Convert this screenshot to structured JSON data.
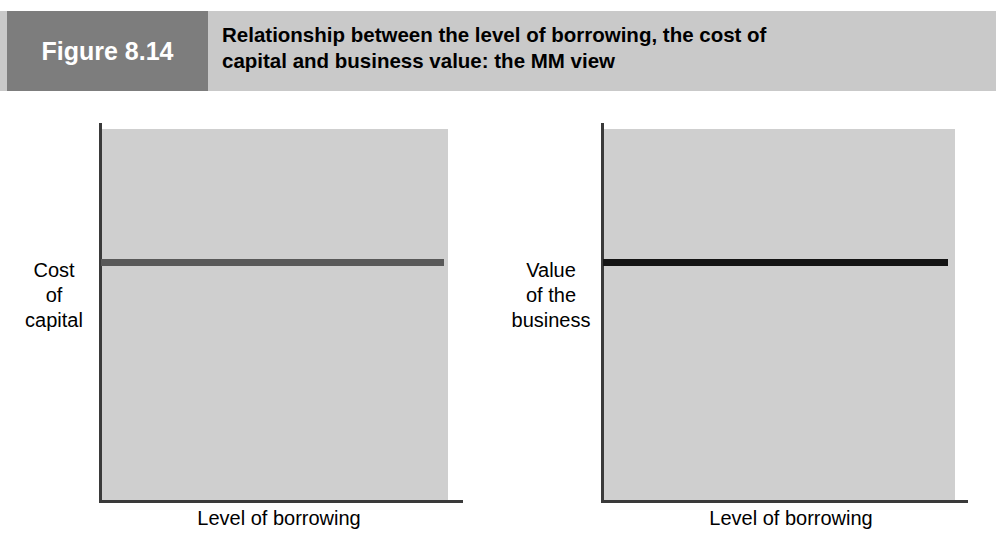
{
  "header": {
    "figure_tag": "Figure 8.14",
    "title_line_1": "Relationship between the level of borrowing, the cost of",
    "title_line_2": "capital and business value: the MM view",
    "tag_background": "#7d7d7d",
    "band_background": "#c9c9c9"
  },
  "chart_data": [
    {
      "id": "cost-of-capital",
      "type": "line",
      "title": "",
      "xlabel": "Level of borrowing",
      "ylabel": "Cost\nof\ncapital",
      "ylabel_lines": [
        "Cost",
        "of",
        "capital"
      ],
      "xlabel_ticks": [],
      "ylabel_ticks": [],
      "grid": false,
      "legend": "none",
      "plot_background": "#cfcfcf",
      "series": [
        {
          "name": "Cost of capital",
          "color": "#595959",
          "x": [
            0,
            100
          ],
          "values": [
            65,
            65
          ],
          "description": "constant horizontal line — cost of capital is invariant to the level of borrowing"
        }
      ],
      "xlim": [
        0,
        100
      ],
      "ylim": [
        0,
        100
      ]
    },
    {
      "id": "value-of-the-business",
      "type": "line",
      "title": "",
      "xlabel": "Level of borrowing",
      "ylabel": "Value\nof the\nbusiness",
      "ylabel_lines": [
        "Value",
        "of the",
        "business"
      ],
      "xlabel_ticks": [],
      "ylabel_ticks": [],
      "grid": false,
      "legend": "none",
      "plot_background": "#cfcfcf",
      "series": [
        {
          "name": "Value of the business",
          "color": "#141414",
          "x": [
            0,
            100
          ],
          "values": [
            65,
            65
          ],
          "description": "constant horizontal line — business value is invariant to the level of borrowing"
        }
      ],
      "xlim": [
        0,
        100
      ],
      "ylim": [
        0,
        100
      ]
    }
  ],
  "charts": {
    "left": {
      "y_label_line_1": "Cost",
      "y_label_line_2": "of",
      "y_label_line_3": "capital",
      "x_label": "Level of borrowing"
    },
    "right": {
      "y_label_line_1": "Value",
      "y_label_line_2": "of the",
      "y_label_line_3": "business",
      "x_label": "Level of borrowing"
    }
  }
}
